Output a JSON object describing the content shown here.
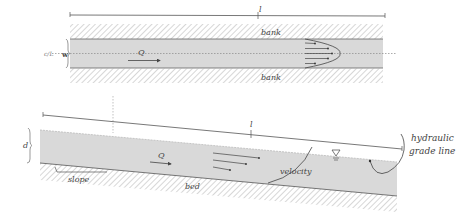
{
  "figure": {
    "colors": {
      "water": "#d9d9d9",
      "hatch": "#b0b0b0",
      "line": "#555555",
      "label": "#444444",
      "background": "#ffffff"
    }
  },
  "plan_view": {
    "length_label": "l",
    "width_label": "w",
    "centerline_label": "c/L",
    "flow_label": "Q",
    "bank_top_label": "bank",
    "bank_bottom_label": "bank",
    "velocity_arrows": 5
  },
  "profile_view": {
    "length_label": "l",
    "depth_label": "d",
    "flow_label": "Q",
    "slope_label": "slope",
    "bed_label": "bed",
    "velocity_label": "velocity",
    "water_surface_symbol": "∇",
    "hgl_label_line1": "hydraulic",
    "hgl_label_line2": "grade line",
    "velocity_arrows": 3
  }
}
